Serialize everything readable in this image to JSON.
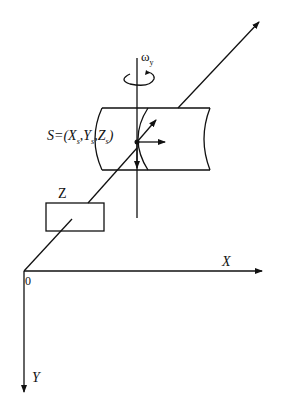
{
  "diagram": {
    "labels": {
      "omega": "ω",
      "omega_sub": "y",
      "point_prefix": "S=(X",
      "sub_s1": "s",
      "comma_y": ",Y",
      "sub_s2": "s",
      "comma_z": ",Z",
      "sub_s3": "s",
      "close": ")",
      "z_box": "Z",
      "x_axis": "X",
      "y_axis": "Y",
      "origin": "0"
    },
    "colors": {
      "stroke": "#111111",
      "background": "#ffffff"
    }
  }
}
